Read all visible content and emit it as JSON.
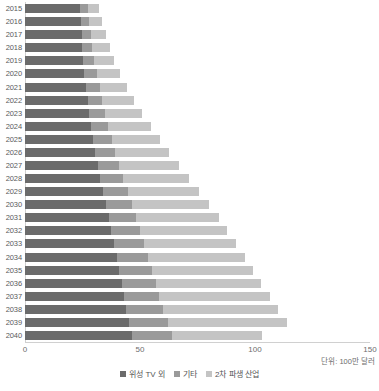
{
  "chart_data": {
    "type": "bar",
    "orientation": "horizontal",
    "stacked": true,
    "title": "",
    "subtitle": "",
    "xlabel": "",
    "ylabel": "",
    "xlim": [
      0,
      150
    ],
    "ylim": null,
    "grid": false,
    "legend_position": "bottom-center",
    "unit_note": "단위: 100만 달러",
    "xticks": [
      0,
      50,
      100,
      150
    ],
    "xtick_labels": [
      "0",
      "50",
      "100",
      "150"
    ],
    "categories": [
      "2015",
      "2016",
      "2017",
      "2018",
      "2019",
      "2020",
      "2021",
      "2022",
      "2023",
      "2024",
      "2025",
      "2026",
      "2027",
      "2028",
      "2029",
      "2030",
      "2031",
      "2032",
      "2033",
      "2034",
      "2035",
      "2036",
      "2037",
      "2038",
      "2039",
      "2040"
    ],
    "series": [
      {
        "name": "위성 TV 외",
        "color": "#6b6b6b",
        "values": [
          24.0,
          24.2,
          24.6,
          24.9,
          25.2,
          25.8,
          26.6,
          27.2,
          28.0,
          28.7,
          29.6,
          30.5,
          31.6,
          32.8,
          34.0,
          35.2,
          36.4,
          37.6,
          38.8,
          39.9,
          41.0,
          42.0,
          43.0,
          44.0,
          45.3,
          46.5
        ]
      },
      {
        "name": "기타",
        "color": "#9a9a9a",
        "values": [
          3.5,
          3.8,
          4.1,
          4.4,
          4.8,
          5.3,
          5.9,
          6.4,
          7.0,
          7.6,
          8.2,
          8.8,
          9.4,
          10.0,
          10.6,
          11.2,
          11.8,
          12.4,
          13.0,
          13.6,
          14.2,
          14.8,
          15.4,
          16.0,
          16.8,
          17.5
        ]
      },
      {
        "name": "2차 파생 산업",
        "color": "#c4c4c4",
        "values": [
          4.5,
          5.5,
          6.5,
          7.5,
          8.5,
          10.0,
          12.0,
          14.0,
          16.0,
          18.5,
          21.0,
          23.5,
          26.0,
          28.5,
          31.0,
          33.5,
          36.0,
          38.0,
          40.0,
          42.0,
          44.0,
          46.0,
          48.0,
          50.0,
          52.0,
          39.0
        ]
      }
    ],
    "totals": [
      32.0,
      33.5,
      35.2,
      36.8,
      38.5,
      41.1,
      44.5,
      47.6,
      51.0,
      54.8,
      58.8,
      62.8,
      67.0,
      71.3,
      75.6,
      79.9,
      84.2,
      88.0,
      91.8,
      95.5,
      99.2,
      102.8,
      106.4,
      110.0,
      114.1,
      103.0
    ]
  },
  "legend": {
    "items": [
      {
        "label": "위성 TV 외",
        "color": "#6b6b6b"
      },
      {
        "label": "기타",
        "color": "#9a9a9a"
      },
      {
        "label": "2차 파생 산업",
        "color": "#c4c4c4"
      }
    ]
  }
}
